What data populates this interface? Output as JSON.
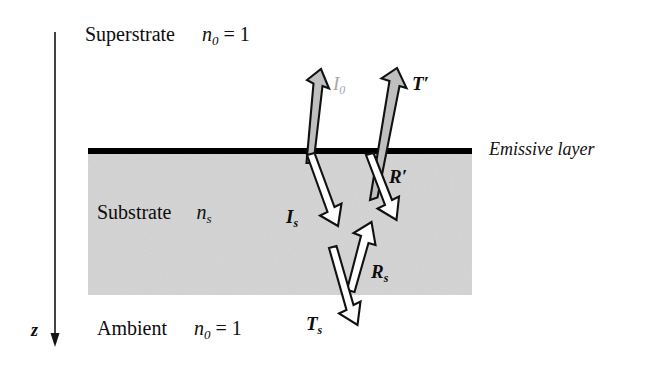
{
  "figure": {
    "type": "optical-stack-ray-diagram",
    "width": 659,
    "height": 367,
    "background_color": "#ffffff"
  },
  "colors": {
    "substrate_fill": "#d4d4d4",
    "emissive_line": "#000000",
    "arrow_outline": "#111111",
    "arrow_fill_white": "#ffffff",
    "arrow_fill_gray": "#bfbfbf",
    "faded_label": "#a8a8a8",
    "text": "#0d0d0d"
  },
  "regions": [
    {
      "id": "superstrate",
      "name": "Superstrate",
      "index_symbol": "n",
      "index_subscript": "0",
      "index_value": "= 1",
      "label_x": 85,
      "label_y": 24
    },
    {
      "id": "substrate",
      "name": "Substrate",
      "index_symbol": "n",
      "index_subscript": "s",
      "index_value": "",
      "label_x": 97,
      "label_y": 202
    },
    {
      "id": "ambient",
      "name": "Ambient",
      "index_symbol": "n",
      "index_subscript": "0",
      "index_value": "= 1",
      "label_x": 97,
      "label_y": 318
    }
  ],
  "interface": {
    "label": "Emissive layer",
    "label_x": 489,
    "label_y": 140,
    "line_y": 151,
    "line_x1": 88,
    "line_x2": 472,
    "line_thickness": 6
  },
  "axis": {
    "label": "z",
    "label_x": 31,
    "label_y": 321,
    "x": 55,
    "y_start": 32,
    "y_end": 346,
    "direction": "down"
  },
  "rays": [
    {
      "id": "I0",
      "symbol": "I",
      "subscript": "0",
      "label_x": 333,
      "label_y": 74,
      "style": "faded",
      "fill": "gray",
      "direction": "up",
      "description": "internal emission escaping through superstrate"
    },
    {
      "id": "Tprime",
      "symbol": "T",
      "subscript": "′",
      "label_x": 412,
      "label_y": 74,
      "style": "bold",
      "fill": "gray",
      "direction": "up",
      "description": "transmitted beam into superstrate"
    },
    {
      "id": "Rprime",
      "symbol": "R",
      "subscript": "′",
      "label_x": 389,
      "label_y": 167,
      "style": "bold",
      "fill": "white",
      "direction": "down",
      "description": "reflected beam back into substrate"
    },
    {
      "id": "Is",
      "symbol": "I",
      "subscript": "s",
      "label_x": 286,
      "label_y": 207,
      "style": "bold",
      "fill": "white",
      "direction": "down",
      "description": "emission launched into substrate"
    },
    {
      "id": "Rs",
      "symbol": "R",
      "subscript": "s",
      "label_x": 371,
      "label_y": 262,
      "style": "bold",
      "fill": "white",
      "direction": "up",
      "description": "reflection at substrate-ambient boundary"
    },
    {
      "id": "Ts",
      "symbol": "T",
      "subscript": "s",
      "label_x": 306,
      "label_y": 314,
      "style": "bold",
      "fill": "white",
      "direction": "down",
      "description": "transmission out into ambient"
    }
  ],
  "substrate_block": {
    "x": 88,
    "y": 154,
    "width": 384,
    "height": 141
  }
}
